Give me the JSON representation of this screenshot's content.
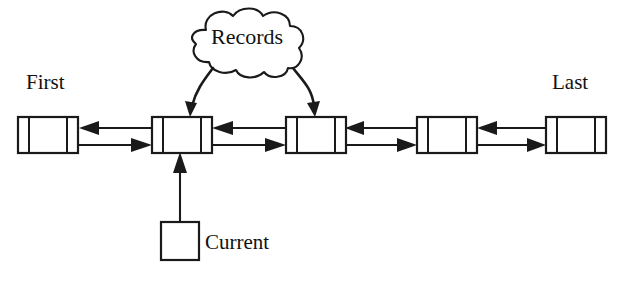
{
  "diagram": {
    "type": "doubly-linked-list",
    "background_color": "#ffffff",
    "stroke_color": "#1a1a1a",
    "labels": {
      "first": "First",
      "last": "Last",
      "current": "Current",
      "records": "Records"
    },
    "cloud": {
      "label": "Records",
      "arrow_targets": [
        "node-2",
        "node-3"
      ],
      "arrow_count": 2
    },
    "nodes": [
      {
        "id": "node-1",
        "index": 1,
        "label": "",
        "cells": 3,
        "pointer": "First"
      },
      {
        "id": "node-2",
        "index": 2,
        "label": "",
        "cells": 3,
        "pointer": "Current"
      },
      {
        "id": "node-3",
        "index": 3,
        "label": "",
        "cells": 3,
        "pointer": ""
      },
      {
        "id": "node-4",
        "index": 4,
        "label": "",
        "cells": 3,
        "pointer": ""
      },
      {
        "id": "node-5",
        "index": 5,
        "label": "",
        "cells": 3,
        "pointer": "Last"
      }
    ],
    "links": [
      {
        "from": "node-2",
        "to": "node-1",
        "direction": "backward"
      },
      {
        "from": "node-1",
        "to": "node-2",
        "direction": "forward"
      },
      {
        "from": "node-3",
        "to": "node-2",
        "direction": "backward"
      },
      {
        "from": "node-2",
        "to": "node-3",
        "direction": "forward"
      },
      {
        "from": "node-4",
        "to": "node-3",
        "direction": "backward"
      },
      {
        "from": "node-3",
        "to": "node-4",
        "direction": "forward"
      },
      {
        "from": "node-5",
        "to": "node-4",
        "direction": "backward"
      },
      {
        "from": "node-4",
        "to": "node-5",
        "direction": "forward"
      }
    ],
    "current_pointer": {
      "label": "Current",
      "target": "node-2",
      "shape": "square"
    }
  }
}
